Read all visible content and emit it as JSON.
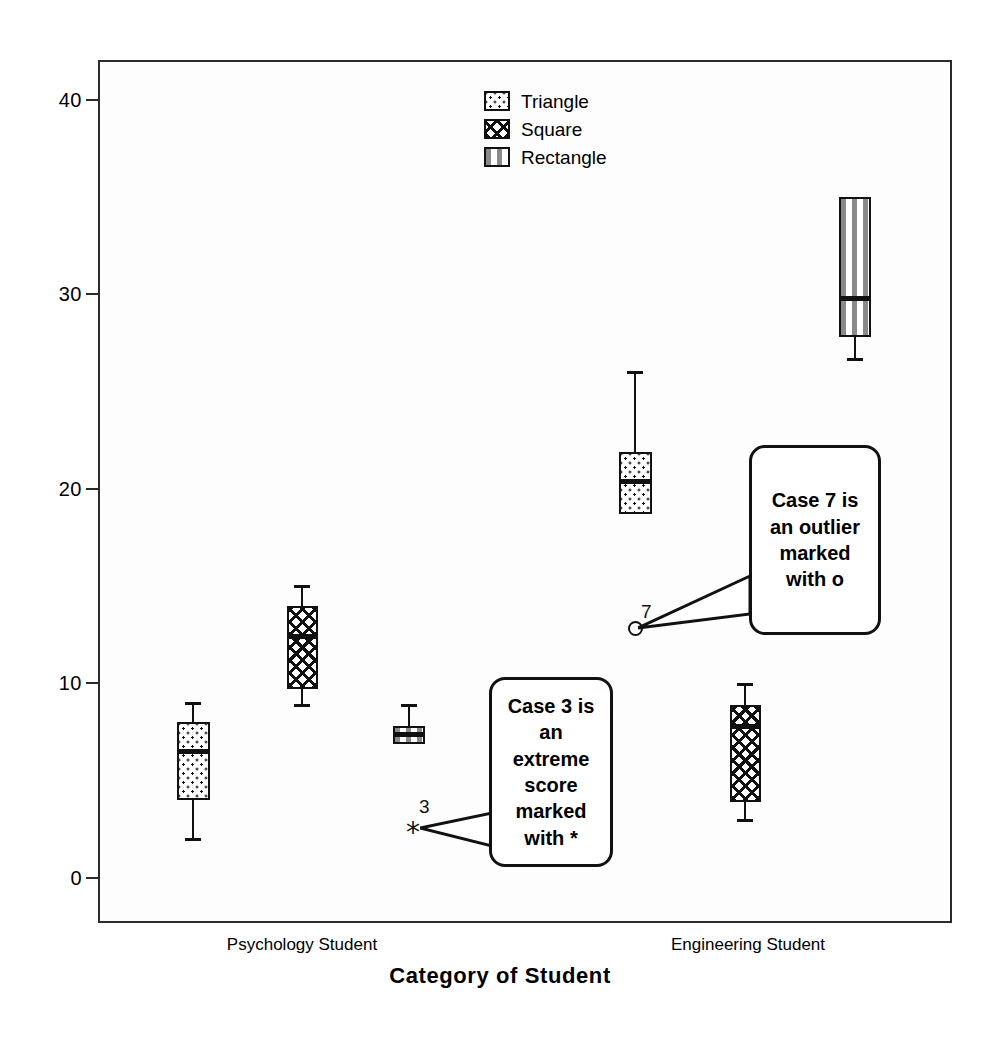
{
  "chart_data": {
    "type": "box",
    "title": "",
    "xlabel": "Category of Student",
    "ylabel": "",
    "ylim": [
      -2,
      42
    ],
    "yticks": [
      0,
      10,
      20,
      30,
      40
    ],
    "ytick_labels": [
      "0",
      "10",
      "20",
      "30",
      "40"
    ],
    "grid": false,
    "legend_position": "top-center",
    "categories": [
      "Psychology Student",
      "Engineering Student"
    ],
    "legend": [
      {
        "label": "Triangle",
        "fill": "dots"
      },
      {
        "label": "Square",
        "fill": "cross-hatch"
      },
      {
        "label": "Rectangle",
        "fill": "vertical-stripes"
      }
    ],
    "series": [
      {
        "name": "Triangle",
        "fill": "dots",
        "boxes": [
          {
            "category": "Psychology Student",
            "whisker_low": 2.0,
            "q1": 4.0,
            "median": 6.5,
            "q3": 8.0,
            "whisker_high": 9.0
          },
          {
            "category": "Engineering Student",
            "whisker_low": 18.7,
            "q1": 18.7,
            "median": 20.4,
            "q3": 21.9,
            "whisker_high": 26.0
          }
        ]
      },
      {
        "name": "Square",
        "fill": "cross-hatch",
        "boxes": [
          {
            "category": "Psychology Student",
            "whisker_low": 8.9,
            "q1": 9.7,
            "median": 12.4,
            "q3": 14.0,
            "whisker_high": 15.0
          },
          {
            "category": "Engineering Student",
            "whisker_low": 3.0,
            "q1": 3.9,
            "median": 7.8,
            "q3": 8.9,
            "whisker_high": 10.0
          }
        ]
      },
      {
        "name": "Rectangle",
        "fill": "vertical-stripes",
        "boxes": [
          {
            "category": "Psychology Student",
            "whisker_low": 6.9,
            "q1": 6.9,
            "median": 7.4,
            "q3": 7.8,
            "whisker_high": 8.9
          },
          {
            "category": "Engineering Student",
            "whisker_low": 26.7,
            "q1": 27.8,
            "median": 29.8,
            "q3": 35.0,
            "whisker_high": 35.0
          }
        ]
      }
    ],
    "markers": [
      {
        "kind": "extreme",
        "symbol": "*",
        "case": "3",
        "value": 2.8,
        "category": "Psychology Student",
        "series": "Rectangle"
      },
      {
        "kind": "outlier",
        "symbol": "o",
        "case": "7",
        "value": 12.9,
        "category": "Engineering Student",
        "series": "Triangle"
      }
    ],
    "annotations": [
      {
        "id": "extreme-callout",
        "text": "Case 3 is an extreme score marked with *"
      },
      {
        "id": "outlier-callout",
        "text": "Case 7 is an outlier marked with o"
      }
    ]
  },
  "axis": {
    "x_title": "Category of Student",
    "x_tick_labels": [
      "Psychology Student",
      "Engineering Student"
    ],
    "y_tick_labels": [
      "40",
      "30",
      "20",
      "10",
      "0"
    ]
  },
  "legend": {
    "items": [
      "Triangle",
      "Square",
      "Rectangle"
    ]
  },
  "markers": {
    "extreme_case_label": "3",
    "extreme_symbol": "*",
    "outlier_case_label": "7"
  },
  "callouts": {
    "extreme": "Case 3 is an extreme score marked with *",
    "outlier": "Case 7 is an outlier marked with o"
  },
  "colors": {
    "ink": "#111111",
    "frame": "#2b2b2b",
    "plot_background": "#fdfdfd",
    "page_background": "#ffffff"
  }
}
